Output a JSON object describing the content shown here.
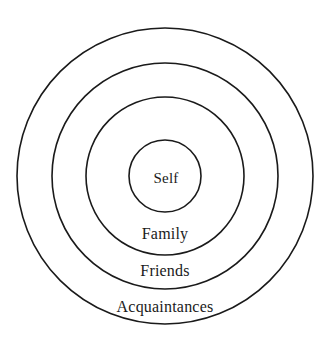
{
  "diagram": {
    "type": "concentric-circles",
    "background_color": "#ffffff",
    "stroke_color": "#1a1a1a",
    "center": {
      "x": 165,
      "y": 176
    },
    "rings": [
      {
        "id": "acquaintances",
        "label": "Acquaintances",
        "radius": 148,
        "stroke_width": 1.6,
        "label_position": {
          "x": 165,
          "y": 307
        }
      },
      {
        "id": "friends",
        "label": "Friends",
        "radius": 113,
        "stroke_width": 1.6,
        "label_position": {
          "x": 165,
          "y": 271
        }
      },
      {
        "id": "family",
        "label": "Family",
        "radius": 79,
        "stroke_width": 1.6,
        "label_position": {
          "x": 165,
          "y": 234
        }
      },
      {
        "id": "self",
        "label": "Self",
        "radius": 36,
        "stroke_width": 1.6,
        "label_position": {
          "x": 166,
          "y": 178
        }
      }
    ]
  }
}
